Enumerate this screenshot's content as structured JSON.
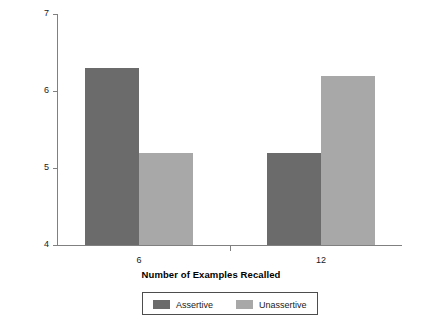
{
  "chart_data": {
    "type": "bar",
    "title": "",
    "xlabel": "Number of Examples Recalled",
    "ylabel": "Rating of Assertiveness",
    "categories": [
      "6",
      "12"
    ],
    "series": [
      {
        "name": "Assertive",
        "color": "#6b6b6b",
        "values": [
          6.3,
          5.2
        ]
      },
      {
        "name": "Unassertive",
        "color": "#a8a8a8",
        "values": [
          5.2,
          6.2
        ]
      }
    ],
    "ylim": [
      4,
      7
    ],
    "yticks": [
      "4",
      "5",
      "6",
      "7"
    ],
    "ytick_values": [
      4,
      5,
      6,
      7
    ],
    "xticks": [
      "6",
      "12"
    ],
    "grid": false,
    "legend_position": "bottom-center",
    "axis_color": "#808080"
  },
  "legend": {
    "entries": [
      {
        "label": "Assertive",
        "color": "#6b6b6b"
      },
      {
        "label": "Unassertive",
        "color": "#a8a8a8"
      }
    ]
  }
}
